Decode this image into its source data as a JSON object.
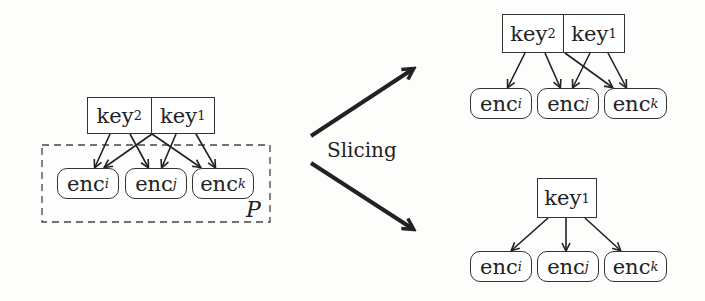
{
  "diagram": {
    "left": {
      "keys": [
        {
          "base": "key",
          "sub": "2"
        },
        {
          "base": "key",
          "sub": "1"
        }
      ],
      "encs": [
        {
          "base": "enc",
          "sub": "i"
        },
        {
          "base": "enc",
          "sub": "j"
        },
        {
          "base": "enc",
          "sub": "k"
        }
      ],
      "partition_label": "P"
    },
    "operation_label": "Slicing",
    "top_right": {
      "keys": [
        {
          "base": "key",
          "sub": "2"
        },
        {
          "base": "key",
          "sub": "1"
        }
      ],
      "encs": [
        {
          "base": "enc",
          "sub": "i"
        },
        {
          "base": "enc",
          "sub": "j"
        },
        {
          "base": "enc",
          "sub": "k"
        }
      ]
    },
    "bottom_right": {
      "keys": [
        {
          "base": "key",
          "sub": "1"
        }
      ],
      "encs": [
        {
          "base": "enc",
          "sub": "i"
        },
        {
          "base": "enc",
          "sub": "j"
        },
        {
          "base": "enc",
          "sub": "k"
        }
      ]
    }
  }
}
